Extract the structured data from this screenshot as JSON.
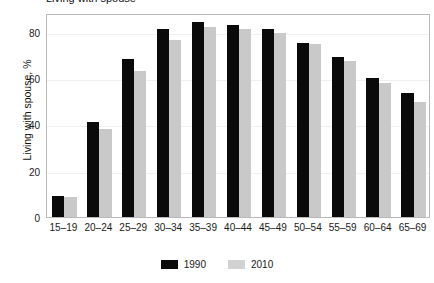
{
  "figure": {
    "top_fragment": "Living with spouse",
    "background": "#ffffff"
  },
  "chart_data": {
    "type": "bar",
    "title": "",
    "xlabel": "",
    "ylabel": "Living with spouse, %",
    "ylim": [
      0,
      88
    ],
    "yticks": [
      0,
      20,
      40,
      60,
      80
    ],
    "ytick_labels": [
      "0",
      "20",
      "40",
      "60",
      "80"
    ],
    "grid": true,
    "legend_position": "bottom-center",
    "categories": [
      "15–19",
      "20–24",
      "25–29",
      "30–34",
      "35–39",
      "40–44",
      "45–49",
      "50–54",
      "55–59",
      "60–64",
      "65–69"
    ],
    "series": [
      {
        "name": "1990",
        "color": "#0a0a0a",
        "values": [
          9,
          41,
          68,
          81,
          84,
          83,
          81,
          75,
          69,
          60,
          53.5
        ]
      },
      {
        "name": "2010",
        "color": "#c9c9c9",
        "values": [
          8.5,
          38,
          63,
          76.5,
          82,
          81,
          79.5,
          74.5,
          67.5,
          58,
          49.5
        ]
      }
    ]
  },
  "legend": {
    "entries": [
      {
        "label": "1990",
        "color": "#0a0a0a"
      },
      {
        "label": "2010",
        "color": "#d2d2d2"
      }
    ]
  }
}
